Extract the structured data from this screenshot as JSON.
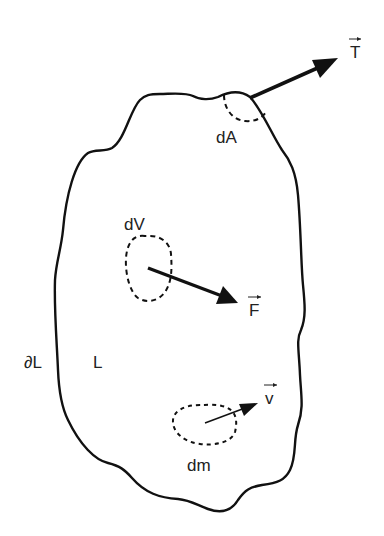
{
  "diagram": {
    "type": "continuum-body-free-body-diagram",
    "colors": {
      "stroke": "#111111",
      "text": "#222222",
      "background": "#ffffff"
    },
    "labels": {
      "traction": "T",
      "area_element": "dA",
      "volume_element": "dV",
      "body_force": "F",
      "boundary": "∂L",
      "body": "L",
      "mass_element": "dm",
      "velocity": "v"
    },
    "vectors": [
      {
        "name": "T",
        "meaning": "traction vector on surface element dA",
        "from": [
          250,
          97
        ],
        "to": [
          338,
          58
        ]
      },
      {
        "name": "F",
        "meaning": "body force on volume element dV",
        "from": [
          148,
          268
        ],
        "to": [
          238,
          302
        ]
      },
      {
        "name": "v",
        "meaning": "velocity of mass element dm",
        "from": [
          206,
          423
        ],
        "to": [
          258,
          403
        ]
      }
    ]
  }
}
